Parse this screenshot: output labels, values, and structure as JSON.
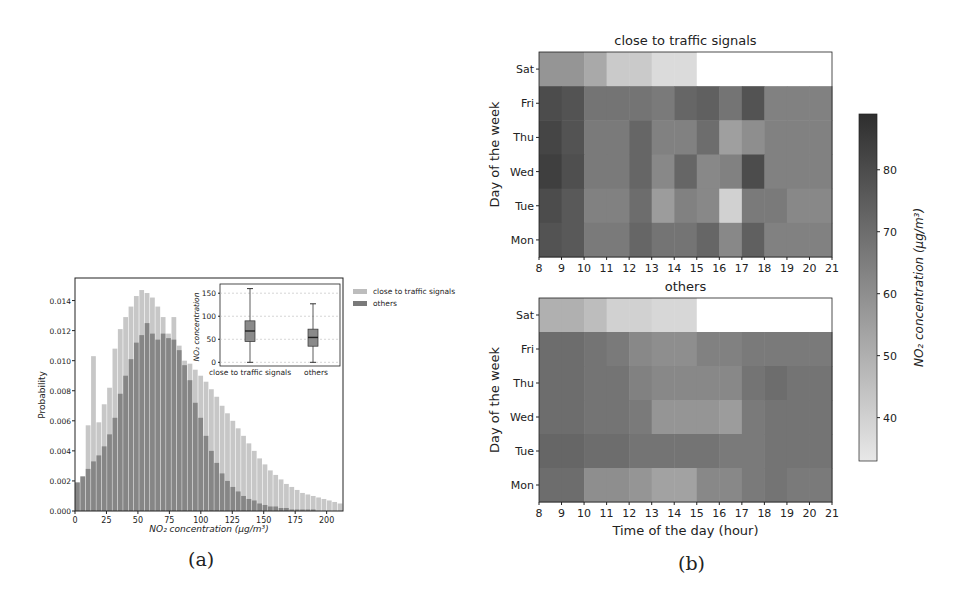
{
  "figure": {
    "caption_a": "(a)",
    "caption_b": "(b)"
  },
  "chart_data": [
    {
      "id": "histogram",
      "type": "bar",
      "title": "",
      "xlabel": "NO₂ concentration (μg/m³)",
      "ylabel": "Probability",
      "xlim": [
        0,
        213
      ],
      "ylim": [
        0,
        0.0155
      ],
      "xticks": [
        0,
        25,
        50,
        75,
        100,
        125,
        150,
        175,
        200
      ],
      "yticks": [
        "0.000",
        "0.002",
        "0.004",
        "0.006",
        "0.008",
        "0.010",
        "0.012",
        "0.014"
      ],
      "legend": {
        "position": "upper right (outside)",
        "entries": [
          "close to traffic signals",
          "others"
        ]
      },
      "bin_width": 4.26,
      "x_start": 0,
      "series": [
        {
          "name": "close to traffic signals",
          "color": "#bdbdbd",
          "values": [
            0.0019,
            0.0023,
            0.0057,
            0.0103,
            0.0059,
            0.0071,
            0.0082,
            0.0108,
            0.0121,
            0.0129,
            0.0136,
            0.0143,
            0.0147,
            0.0145,
            0.0142,
            0.0136,
            0.0129,
            0.0118,
            0.0129,
            0.011,
            0.01,
            0.0098,
            0.0094,
            0.009,
            0.0086,
            0.0081,
            0.0076,
            0.007,
            0.0065,
            0.006,
            0.0055,
            0.005,
            0.0045,
            0.004,
            0.0035,
            0.0031,
            0.0027,
            0.0024,
            0.0021,
            0.0018,
            0.0016,
            0.0014,
            0.0012,
            0.0011,
            0.001,
            0.0009,
            0.0008,
            0.0007,
            0.0006,
            0.0005
          ]
        },
        {
          "name": "others",
          "color": "#7a7a7a",
          "values": [
            0.0019,
            0.0023,
            0.0028,
            0.0033,
            0.0037,
            0.0043,
            0.0051,
            0.0062,
            0.0078,
            0.009,
            0.0101,
            0.0112,
            0.0117,
            0.0125,
            0.0118,
            0.0114,
            0.0118,
            0.0115,
            0.0114,
            0.0107,
            0.0097,
            0.0087,
            0.0072,
            0.0062,
            0.005,
            0.004,
            0.0032,
            0.0025,
            0.002,
            0.0016,
            0.0013,
            0.001,
            0.0008,
            0.0007,
            0.0005,
            0.0004,
            0.0003,
            0.0003,
            0.0002,
            0.0002,
            0.0001,
            0.0001,
            0.0001,
            0.0001,
            0.0001,
            0.0,
            0.0,
            0.0,
            0.0,
            0.0
          ]
        }
      ]
    },
    {
      "id": "inset-boxplot",
      "type": "box",
      "ylabel": "NO₂ concentration",
      "ylim": [
        -8,
        170
      ],
      "yticks": [
        0,
        50,
        100,
        150
      ],
      "categories": [
        "close to traffic signals",
        "others"
      ],
      "boxes": [
        {
          "name": "close to traffic signals",
          "whisker_low": 0,
          "q1": 45,
          "median": 68,
          "q3": 90,
          "whisker_high": 160
        },
        {
          "name": "others",
          "whisker_low": 0,
          "q1": 35,
          "median": 54,
          "q3": 72,
          "whisker_high": 127
        }
      ]
    },
    {
      "id": "heatmap-close",
      "type": "heatmap",
      "title": "close to traffic signals",
      "xlabel": "",
      "ylabel": "Day of the week",
      "x": [
        8,
        9,
        10,
        11,
        12,
        13,
        14,
        15,
        16,
        17,
        18,
        19,
        20
      ],
      "xticks": [
        8,
        9,
        10,
        11,
        12,
        13,
        14,
        15,
        16,
        17,
        18,
        19,
        20,
        21
      ],
      "y": [
        "Sat",
        "Fri",
        "Thu",
        "Wed",
        "Tue",
        "Mon"
      ],
      "z": [
        [
          58,
          58,
          52,
          42,
          42,
          37,
          37,
          null,
          null,
          null,
          null,
          null,
          null
        ],
        [
          80,
          78,
          68,
          68,
          68,
          66,
          72,
          74,
          68,
          78,
          64,
          64,
          64
        ],
        [
          82,
          78,
          66,
          66,
          72,
          64,
          64,
          70,
          55,
          60,
          64,
          64,
          64
        ],
        [
          84,
          79,
          66,
          66,
          72,
          62,
          72,
          62,
          64,
          80,
          64,
          64,
          64
        ],
        [
          80,
          76,
          64,
          64,
          70,
          56,
          64,
          62,
          40,
          66,
          66,
          62,
          62
        ],
        [
          78,
          76,
          66,
          66,
          72,
          68,
          68,
          72,
          62,
          74,
          64,
          64,
          64
        ]
      ]
    },
    {
      "id": "heatmap-others",
      "type": "heatmap",
      "title": "others",
      "xlabel": "Time of the day (hour)",
      "ylabel": "Day of the week",
      "x": [
        8,
        9,
        10,
        11,
        12,
        13,
        14,
        15,
        16,
        17,
        18,
        19,
        20
      ],
      "xticks": [
        8,
        9,
        10,
        11,
        12,
        13,
        14,
        15,
        16,
        17,
        18,
        19,
        20,
        21
      ],
      "y": [
        "Sat",
        "Fri",
        "Thu",
        "Wed",
        "Tue",
        "Mon"
      ],
      "z": [
        [
          50,
          50,
          46,
          40,
          40,
          38,
          38,
          null,
          null,
          null,
          null,
          null,
          null
        ],
        [
          70,
          70,
          68,
          66,
          62,
          60,
          60,
          64,
          64,
          66,
          66,
          66,
          66
        ],
        [
          70,
          70,
          68,
          68,
          64,
          62,
          62,
          62,
          62,
          68,
          70,
          68,
          68
        ],
        [
          70,
          70,
          68,
          68,
          66,
          58,
          58,
          58,
          56,
          66,
          68,
          68,
          68
        ],
        [
          72,
          72,
          70,
          70,
          68,
          68,
          68,
          68,
          66,
          66,
          68,
          68,
          68
        ],
        [
          70,
          70,
          60,
          60,
          58,
          54,
          54,
          62,
          62,
          66,
          68,
          66,
          66
        ]
      ]
    },
    {
      "id": "colorbar",
      "type": "colorbar",
      "label": "NO₂ concentration (μg/m³)",
      "range": [
        33,
        89
      ],
      "ticks": [
        40,
        50,
        60,
        70,
        80
      ],
      "color_low": "#e8e8e8",
      "color_high": "#2e2e2e"
    }
  ]
}
